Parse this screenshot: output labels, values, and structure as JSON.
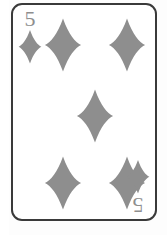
{
  "card": {
    "rank": "5",
    "suit_name": "diamonds",
    "suit_symbol": "♦",
    "display_name": "5 of Diamonds",
    "pip_count": 5,
    "colors": {
      "pip": "#8e8e8e",
      "rank_text": "#8e8e8e",
      "border": "#3a3a3a",
      "face": "#ffffff",
      "background": "#fdfdfd"
    },
    "indices": [
      {
        "position": "top-left",
        "rank": "5",
        "suit_symbol": "♦",
        "rotated": false
      },
      {
        "position": "bottom-right",
        "rank": "5",
        "suit_symbol": "♦",
        "rotated": true
      }
    ],
    "pips": [
      {
        "position": "top-left"
      },
      {
        "position": "top-right"
      },
      {
        "position": "middle-center"
      },
      {
        "position": "bottom-left"
      },
      {
        "position": "bottom-right"
      }
    ]
  }
}
